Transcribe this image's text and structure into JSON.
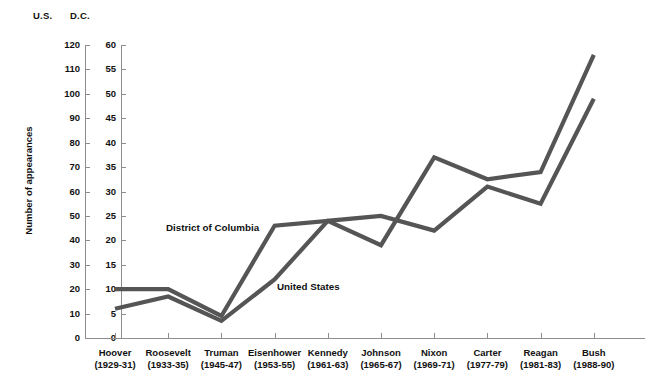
{
  "chart_data": {
    "type": "line",
    "title": "",
    "xlabel": "",
    "ylabel": "Number of appearances",
    "axis_headers": {
      "left": "U.S.",
      "right": "D.C."
    },
    "categories": [
      "Hoover",
      "Roosevelt",
      "Truman",
      "Eisenhower",
      "Kennedy",
      "Johnson",
      "Nixon",
      "Carter",
      "Reagan",
      "Bush"
    ],
    "category_years": [
      "(1929-31)",
      "(1933-35)",
      "(1945-47)",
      "(1953-55)",
      "(1961-63)",
      "(1965-67)",
      "(1969-71)",
      "(1977-79)",
      "(1981-83)",
      "(1988-90)"
    ],
    "axes": {
      "us": {
        "ticks": [
          0,
          10,
          20,
          30,
          40,
          50,
          60,
          70,
          80,
          90,
          100,
          110,
          120
        ],
        "ylim": [
          0,
          120
        ]
      },
      "dc": {
        "ticks": [
          0,
          5,
          10,
          15,
          20,
          25,
          30,
          35,
          40,
          45,
          50,
          55,
          60
        ],
        "ylim": [
          0,
          60
        ]
      },
      "grid": false,
      "legend": "inline-labels"
    },
    "series": [
      {
        "name": "United States",
        "axis": "us",
        "color": "#555555",
        "values": [
          12,
          17,
          7,
          24,
          48,
          50,
          44,
          62,
          55,
          98
        ],
        "label_position": {
          "x": 277,
          "y": 281
        }
      },
      {
        "name": "District of Columbia",
        "axis": "dc",
        "color": "#555555",
        "values": [
          10,
          10,
          4.5,
          23,
          24,
          19,
          37,
          32.5,
          34,
          58
        ],
        "label_position": {
          "x": 166,
          "y": 222
        }
      }
    ]
  },
  "colors": {
    "line": "#555555",
    "axis": "#8c8c8c",
    "text": "#111111",
    "background": "#ffffff"
  }
}
